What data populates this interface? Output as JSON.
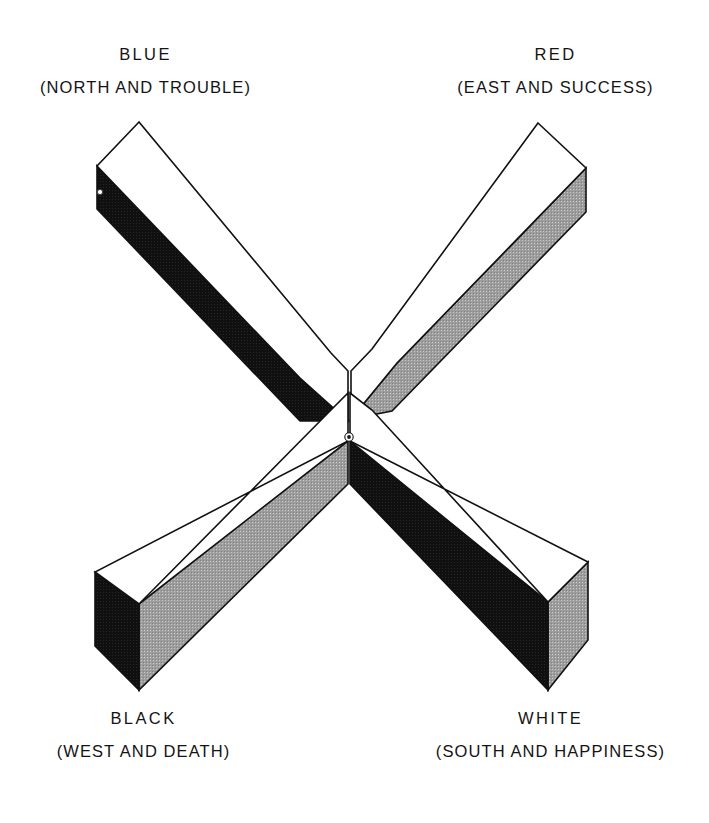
{
  "figure": {
    "background_color": "#ffffff",
    "outline_color": "#111111",
    "face_colors": {
      "top": "#ffffff",
      "shadow_dark": "#111111",
      "shadow_gray": "#a0a0a0"
    },
    "center_marker": {
      "name": "center-dot",
      "outer_color": "#ffffff",
      "inner_color": "#1a1a1a",
      "x": 349,
      "y": 437,
      "radius": 4.2
    }
  },
  "labels": {
    "top_left": {
      "name": "BLUE",
      "detail": "(NORTH AND TROUBLE)",
      "color_word": "BLUE",
      "direction": "NORTH",
      "concept": "TROUBLE",
      "arm": "upper-left"
    },
    "top_right": {
      "name": "RED",
      "detail": "(EAST AND SUCCESS)",
      "color_word": "RED",
      "direction": "EAST",
      "concept": "SUCCESS",
      "arm": "upper-right"
    },
    "bottom_left": {
      "name": "BLACK",
      "detail": "(WEST AND DEATH)",
      "color_word": "BLACK",
      "direction": "WEST",
      "concept": "DEATH",
      "arm": "lower-left"
    },
    "bottom_right": {
      "name": "WHITE",
      "detail": "(SOUTH AND HAPPINESS)",
      "color_word": "WHITE",
      "direction": "SOUTH",
      "concept": "HAPPINESS",
      "arm": "lower-right"
    }
  },
  "geometry": {
    "arms": [
      {
        "id": "upper-left",
        "top_face": "M139,122 L97,166 L300,378 L348,421 L348,370 L330,352 Z",
        "side_face": "M97,166 L97,208 L300,421 L348,421 L300,378 Z",
        "side_shade": "dark"
      },
      {
        "id": "upper-right",
        "top_face": "M538,123 L586,168 L398,362 L350,418 L350,370 L372,348 Z",
        "side_face": "M586,168 L586,212 L398,405 L350,418 L398,362 Z",
        "side_shade": "gray"
      },
      {
        "id": "lower-left",
        "top_face": "M348,440 L348,392 L330,410 L139,604 L95,572 L95,614 Z",
        "side_face": "M95,614 L139,646 L139,690 L348,484 L348,440 Z",
        "side_shade": "gray",
        "end_cap": "M95,572 L95,614 L139,646 L139,604 Z",
        "end_cap_shade": "dark"
      },
      {
        "id": "lower-right",
        "top_face": "M350,440 L350,392 L372,410 L545,597 L588,562 L588,604 Z",
        "side_face": "M350,440 L350,484 L548,690 L548,646 Z",
        "side_shade": "dark",
        "end_cap": "M588,562 L588,604 L548,646 L548,690 L545,597 Z",
        "end_cap_shade": "gray"
      }
    ]
  }
}
